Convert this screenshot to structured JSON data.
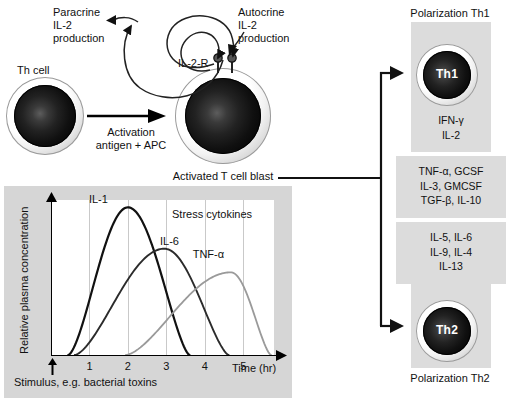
{
  "left": {
    "paracrine_label": "Paracrine\nIL-2\nproduction",
    "autocrine_label": "Autocrine\nIL-2\nproduction",
    "th_cell_label": "Th cell",
    "activation_label": "Activation\nantigen + APC",
    "receptor_label": "IL-2-R",
    "blast_label": "Activated T cell blast"
  },
  "right": {
    "th1_polarization": "Polarization Th1",
    "th1_cell_label": "Th1",
    "th1_cytokines": "IFN-γ\nIL-2",
    "shared_cytokines": "TNF-α, GCSF\nIL-3, GMCSF\nTGF-β, IL-10",
    "th2_cytokines": "IL-5, IL-6\nIL-9, IL-4\nIL-13",
    "th2_cell_label": "Th2",
    "th2_polarization": "Polarization Th2"
  },
  "chart_data": {
    "type": "line",
    "title": "Stress cytokines",
    "xlabel": "Time (hr)",
    "ylabel": "Relative plasma concentration",
    "xlim": [
      0,
      5.8
    ],
    "ylim": [
      0,
      1.05
    ],
    "xticks": [
      1,
      2,
      3,
      4,
      5
    ],
    "xtick_labels": [
      "1",
      "2",
      "3",
      "4",
      "5"
    ],
    "yticks": [],
    "grid": true,
    "grid_axis": "x",
    "legend": "inline-labels",
    "annotation": "Stimulus, e.g. bacterial toxins",
    "annotation_x": 0.22,
    "series": [
      {
        "name": "IL-1",
        "color": "#111111",
        "width": 2.2,
        "peak_x": 2.0,
        "peak_y": 1.0,
        "onset_x": 0.45,
        "end_x": 3.6,
        "label_x": 1.35,
        "label_y": 1.0
      },
      {
        "name": "IL-6",
        "color": "#2b2b2b",
        "width": 1.9,
        "peak_x": 2.95,
        "peak_y": 0.72,
        "onset_x": 0.62,
        "end_x": 4.62,
        "label_x": 3.2,
        "label_y": 0.72
      },
      {
        "name": "TNF-α",
        "color": "#9a9a9a",
        "width": 1.8,
        "peak_x": 4.68,
        "peak_y": 0.56,
        "onset_x": 1.95,
        "end_x": 5.72,
        "label_x": 4.05,
        "label_y": 0.63
      }
    ]
  }
}
